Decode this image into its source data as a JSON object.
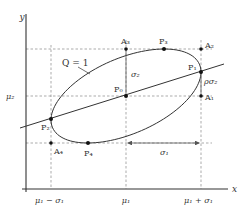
{
  "diagram": {
    "axes": {
      "x_label": "x",
      "y_label": "y"
    },
    "x_ticks": [
      "μ₁ − σ₁",
      "μ₁",
      "μ₁ + σ₁"
    ],
    "y_ticks": [
      "μ₂"
    ],
    "curve_label": "Q = 1",
    "points": {
      "P0": "P₀",
      "P1": "P₁",
      "P2": "P₂",
      "P3": "P₃",
      "P4": "P₄",
      "A1": "A₁",
      "A2": "A₂",
      "A3": "A₃",
      "A4": "A₄"
    },
    "annotations": {
      "sigma2": "σ₂",
      "rho_sigma2": "ρσ₂",
      "sigma1": "σ₁"
    },
    "colors": {
      "line": "#333333",
      "dashed": "#777777",
      "background": "#ffffff"
    }
  }
}
